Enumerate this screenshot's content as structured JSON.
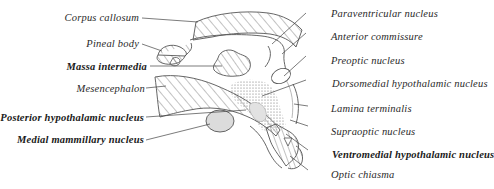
{
  "figure": {
    "type": "anatomical-diagram",
    "line_color": "#555555",
    "stipple_color": "#777777",
    "shade_color": "#dddddd"
  },
  "labels_left": [
    {
      "id": "corpus-callosum",
      "text": "Corpus callosum",
      "bold": false
    },
    {
      "id": "pineal-body",
      "text": "Pineal body",
      "bold": false
    },
    {
      "id": "massa-intermedia",
      "text": "Massa intermedia",
      "bold": true
    },
    {
      "id": "mesencephalon",
      "text": "Mesencephalon",
      "bold": false
    },
    {
      "id": "posterior-hypothalamic-nucleus",
      "text": "Posterior hypothalamic nucleus",
      "bold": true
    },
    {
      "id": "medial-mammillary-nucleus",
      "text": "Medial mammillary nucleus",
      "bold": true
    }
  ],
  "labels_right": [
    {
      "id": "paraventricular-nucleus",
      "text": "Paraventricular nucleus",
      "bold": false
    },
    {
      "id": "anterior-commissure",
      "text": "Anterior commissure",
      "bold": false
    },
    {
      "id": "preoptic-nucleus",
      "text": "Preoptic nucleus",
      "bold": false
    },
    {
      "id": "dorsomedial-hypothalamic-nucleus",
      "text": "Dorsomedial hypothalamic nucleus",
      "bold": false
    },
    {
      "id": "lamina-terminalis",
      "text": "Lamina terminalis",
      "bold": false
    },
    {
      "id": "supraoptic-nucleus",
      "text": "Supraoptic nucleus",
      "bold": false
    },
    {
      "id": "ventromedial-hypothalamic-nucleus",
      "text": "Ventromedial hypothalamic nucleus",
      "bold": true
    },
    {
      "id": "optic-chiasma",
      "text": "Optic chiasma",
      "bold": false
    }
  ]
}
